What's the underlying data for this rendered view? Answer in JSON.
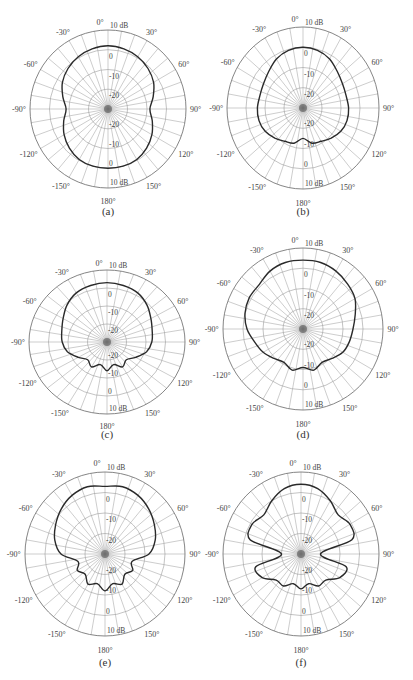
{
  "figure": {
    "ring_labels": [
      "10 dB",
      "0",
      "-10",
      "-20"
    ],
    "ring_db": [
      10,
      0,
      -10,
      -20
    ],
    "min_db": -30,
    "max_db": 10,
    "angle_labels": [
      {
        "deg": 0,
        "text": "0°"
      },
      {
        "deg": 30,
        "text": "30°"
      },
      {
        "deg": 60,
        "text": "60°"
      },
      {
        "deg": 90,
        "text": "90°"
      },
      {
        "deg": 120,
        "text": "120°"
      },
      {
        "deg": 150,
        "text": "150°"
      },
      {
        "deg": 180,
        "text": "180°"
      },
      {
        "deg": -150,
        "text": "-150°"
      },
      {
        "deg": -120,
        "text": "-120°"
      },
      {
        "deg": -90,
        "text": "-90°"
      },
      {
        "deg": -60,
        "text": "-60°"
      },
      {
        "deg": -30,
        "text": "-30°"
      }
    ],
    "colors": {
      "grid": "#9a9a9a",
      "curve": "#2a2a2a",
      "text": "#444444"
    }
  },
  "chart_data": [
    {
      "type": "polar-line",
      "title": "(a)",
      "rlabel": "dB",
      "rlim": [
        -30,
        10
      ],
      "rticks": [
        10,
        0,
        -10,
        -20
      ],
      "angle_deg": [
        0,
        15,
        30,
        45,
        60,
        75,
        90,
        105,
        120,
        135,
        150,
        165,
        180,
        195,
        210,
        225,
        240,
        255,
        270,
        285,
        300,
        315,
        330,
        345
      ],
      "values_db": [
        2,
        1.5,
        0.5,
        -1,
        -3,
        -6,
        -8.5,
        -6.5,
        -4,
        -2,
        -0.5,
        0,
        0,
        0,
        -0.5,
        -2,
        -4,
        -6.5,
        -8.5,
        -6,
        -3,
        -1,
        0.5,
        1.5
      ]
    },
    {
      "type": "polar-line",
      "title": "(b)",
      "rlabel": "dB",
      "rlim": [
        -30,
        10
      ],
      "rticks": [
        10,
        0,
        -10,
        -20
      ],
      "angle_deg": [
        0,
        15,
        30,
        45,
        60,
        75,
        90,
        105,
        120,
        135,
        150,
        165,
        180,
        195,
        210,
        225,
        240,
        255,
        270,
        285,
        300,
        315,
        330,
        345
      ],
      "values_db": [
        0,
        -0.5,
        -2,
        -4.5,
        -6,
        -6.5,
        -6,
        -6,
        -7,
        -9,
        -11,
        -12,
        -15,
        -12,
        -11,
        -9,
        -7,
        -6,
        -6,
        -6.5,
        -6,
        -4.5,
        -2,
        -0.5
      ]
    },
    {
      "type": "polar-line",
      "title": "(c)",
      "rlabel": "dB",
      "rlim": [
        -30,
        10
      ],
      "rticks": [
        10,
        0,
        -10,
        -20
      ],
      "angle_deg": [
        0,
        15,
        30,
        45,
        60,
        75,
        90,
        105,
        120,
        135,
        150,
        165,
        180,
        195,
        210,
        225,
        240,
        255,
        270,
        285,
        300,
        315,
        330,
        345
      ],
      "values_db": [
        3,
        2.5,
        1.5,
        -1,
        -4,
        -6,
        -7,
        -9,
        -13,
        -16,
        -14,
        -17,
        -14,
        -17,
        -14,
        -16,
        -13,
        -9,
        -7,
        -6,
        -4,
        -1,
        1.5,
        2.5
      ]
    },
    {
      "type": "polar-line",
      "title": "(d)",
      "rlabel": "dB",
      "rlim": [
        -30,
        10
      ],
      "rticks": [
        10,
        0,
        -10,
        -20
      ],
      "angle_deg": [
        0,
        15,
        30,
        45,
        60,
        75,
        90,
        105,
        120,
        135,
        150,
        165,
        180,
        195,
        210,
        225,
        240,
        255,
        270,
        285,
        300,
        315,
        330,
        345
      ],
      "values_db": [
        4,
        4,
        3,
        1.5,
        0,
        -3,
        -5,
        -6,
        -7,
        -9.5,
        -11,
        -9,
        -11,
        -9,
        -11,
        -9.5,
        -7,
        -5,
        -2,
        0,
        1,
        1,
        3,
        4
      ]
    },
    {
      "type": "polar-line",
      "title": "(e)",
      "rlabel": "dB",
      "rlim": [
        -30,
        10
      ],
      "rticks": [
        10,
        0,
        -10,
        -20
      ],
      "angle_deg": [
        0,
        15,
        30,
        45,
        60,
        75,
        90,
        105,
        120,
        135,
        150,
        165,
        180,
        195,
        210,
        225,
        240,
        255,
        270,
        285,
        300,
        315,
        330,
        345
      ],
      "values_db": [
        3,
        4,
        3,
        1,
        -1.5,
        -4,
        -8,
        -16,
        -14,
        -16,
        -13,
        -15,
        -12,
        -15,
        -13,
        -16,
        -14,
        -16,
        -8,
        -4,
        -1.5,
        1,
        3,
        4
      ]
    },
    {
      "type": "polar-line",
      "title": "(f)",
      "rlabel": "dB",
      "rlim": [
        -30,
        10
      ],
      "rticks": [
        10,
        0,
        -10,
        -20
      ],
      "angle_deg": [
        0,
        15,
        30,
        45,
        60,
        75,
        90,
        105,
        120,
        135,
        150,
        165,
        180,
        195,
        210,
        225,
        240,
        255,
        270,
        285,
        300,
        315,
        330,
        345
      ],
      "values_db": [
        4,
        3,
        0,
        -3,
        -1,
        -3,
        -20,
        -6,
        -7,
        -12,
        -12,
        -15,
        -13,
        -15,
        -12,
        -12,
        -7,
        -6,
        -20,
        -3,
        -1,
        -3,
        0,
        3
      ]
    }
  ],
  "panels": [
    {
      "caption": "(a)",
      "cx": 108,
      "cy": 109,
      "rx": 78,
      "ry": 79,
      "cap_y": 205
    },
    {
      "caption": "(b)",
      "cx": 303,
      "cy": 108,
      "rx": 76,
      "ry": 81,
      "cap_y": 205
    },
    {
      "caption": "(c)",
      "cx": 107,
      "cy": 342,
      "rx": 78,
      "ry": 72,
      "cap_y": 428
    },
    {
      "caption": "(d)",
      "cx": 303,
      "cy": 329,
      "rx": 80,
      "ry": 81,
      "cap_y": 428
    },
    {
      "caption": "(e)",
      "cx": 105,
      "cy": 554,
      "rx": 80,
      "ry": 82,
      "cap_y": 656
    },
    {
      "caption": "(f)",
      "cx": 301,
      "cy": 554,
      "rx": 78,
      "ry": 82,
      "cap_y": 656
    }
  ]
}
